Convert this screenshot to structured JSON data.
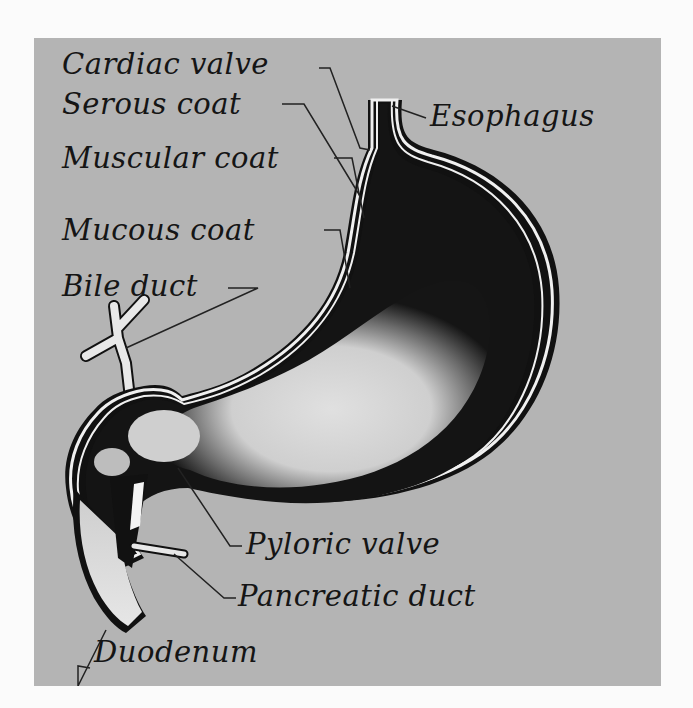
{
  "diagram": {
    "labels": {
      "cardiac_valve": "Cardiac valve",
      "serous_coat": "Serous coat",
      "muscular_coat": "Muscular coat",
      "mucous_coat": "Mucous coat",
      "bile_duct": "Bile duct",
      "esophagus": "Esophagus",
      "pyloric_valve": "Pyloric valve",
      "pancreatic_duct": "Pancreatic duct",
      "duodenum": "Duodenum"
    },
    "colors": {
      "page_background": "#fbfbfb",
      "panel_background": "#b4b4b4",
      "outline": "#111111",
      "wall_white": "#f2f2f2",
      "interior_dark": "#141414",
      "interior_light": "#d8d8d8"
    }
  }
}
